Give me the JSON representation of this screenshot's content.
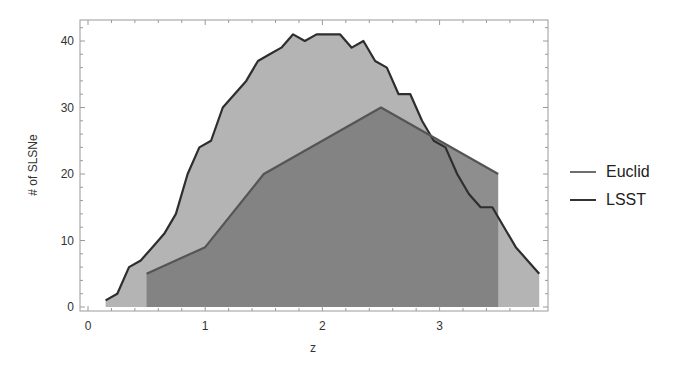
{
  "chart_data": {
    "type": "area",
    "title": "",
    "xlabel": "z",
    "ylabel": "# of SLSNe",
    "xlim": [
      -0.05,
      3.95
    ],
    "ylim": [
      -0.8,
      43
    ],
    "xticks": [
      0,
      1,
      2,
      3
    ],
    "yticks": [
      0,
      10,
      20,
      30,
      40
    ],
    "grid": false,
    "legend_position": "right",
    "series": [
      {
        "name": "Euclid",
        "fill": "#7a7a7a",
        "line": "#555555",
        "x": [
          0.5,
          1.0,
          1.5,
          2.5,
          3.5
        ],
        "values": [
          5,
          9,
          20,
          30,
          20
        ]
      },
      {
        "name": "LSST",
        "fill": "#b4b4b4",
        "line": "#2e2e2e",
        "x": [
          0.15,
          0.25,
          0.35,
          0.45,
          0.55,
          0.65,
          0.75,
          0.85,
          0.95,
          1.05,
          1.15,
          1.25,
          1.35,
          1.45,
          1.55,
          1.65,
          1.75,
          1.85,
          1.95,
          2.05,
          2.15,
          2.25,
          2.35,
          2.45,
          2.55,
          2.65,
          2.75,
          2.85,
          2.95,
          3.05,
          3.15,
          3.25,
          3.35,
          3.45,
          3.55,
          3.65,
          3.75,
          3.85
        ],
        "values": [
          1,
          2,
          6,
          7,
          9,
          11,
          14,
          20,
          24,
          25,
          30,
          32,
          34,
          37,
          38,
          39,
          41,
          40,
          41,
          41,
          41,
          39,
          40,
          37,
          36,
          32,
          32,
          28,
          25,
          24,
          20,
          17,
          15,
          15,
          12,
          9,
          7,
          5
        ]
      }
    ]
  },
  "legend": {
    "items": [
      {
        "label": "Euclid",
        "color": "#6e6e6e"
      },
      {
        "label": "LSST",
        "color": "#333333"
      }
    ]
  }
}
